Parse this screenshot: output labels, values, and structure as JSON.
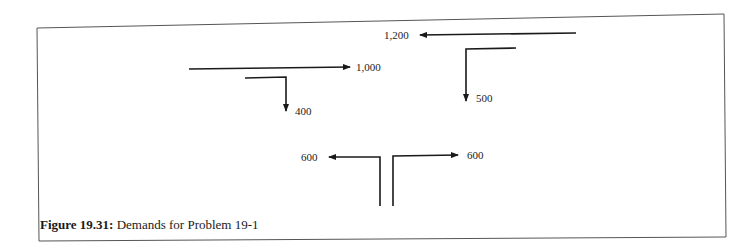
{
  "figure": {
    "caption": {
      "number": "Figure 19.31:",
      "text": "Demands for Problem 19-1"
    },
    "movements": [
      {
        "id": "through-east",
        "label": "1,000",
        "direction": "eastbound through"
      },
      {
        "id": "right-turn-south-a",
        "label": "400",
        "direction": "right turn (southbound)"
      },
      {
        "id": "through-west",
        "label": "1,200",
        "direction": "westbound through"
      },
      {
        "id": "left-turn-south",
        "label": "500",
        "direction": "left turn (southbound)"
      },
      {
        "id": "northbound-left",
        "label": "600",
        "direction": "northbound left turn"
      },
      {
        "id": "northbound-right",
        "label": "600",
        "direction": "northbound right turn"
      }
    ],
    "colors": {
      "line": "#1a1a1a",
      "frame": "#555555",
      "background": "#ffffff"
    }
  }
}
